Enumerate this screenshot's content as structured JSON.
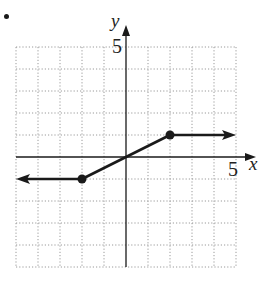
{
  "chart_data": {
    "type": "line",
    "title": "",
    "xlabel": "x",
    "ylabel": "y",
    "xlim": [
      -5,
      5
    ],
    "ylim": [
      -5,
      5
    ],
    "grid": true,
    "grid_style": "dotted",
    "tick_labels": {
      "x": [
        "5"
      ],
      "y": [
        "5"
      ]
    },
    "series": [
      {
        "name": "piecewise f(x)",
        "points": [
          [
            -5,
            -1
          ],
          [
            -2,
            -1
          ],
          [
            0,
            0
          ],
          [
            2,
            1
          ],
          [
            5,
            1
          ]
        ],
        "closed_points": [
          [
            -2,
            -1
          ],
          [
            2,
            1
          ]
        ],
        "arrow_left": true,
        "arrow_right": true,
        "color": "#1a1a1a"
      }
    ]
  },
  "labels": {
    "x_axis": "x",
    "y_axis": "y",
    "x_tick": "5",
    "y_tick": "5"
  },
  "colors": {
    "grid": "#9a9a9a",
    "axis": "#1a1a1a",
    "curve": "#1a1a1a"
  }
}
